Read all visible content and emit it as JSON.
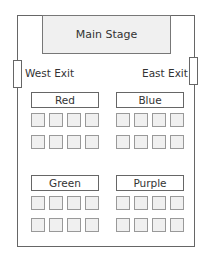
{
  "stage": {
    "label": "Main Stage"
  },
  "exits": {
    "west": {
      "label": "West Exit"
    },
    "east": {
      "label": "East Exit"
    }
  },
  "sections": [
    {
      "name": "Red",
      "rows": 2,
      "seats_per_row": 4
    },
    {
      "name": "Blue",
      "rows": 2,
      "seats_per_row": 4
    },
    {
      "name": "Green",
      "rows": 2,
      "seats_per_row": 4
    },
    {
      "name": "Purple",
      "rows": 2,
      "seats_per_row": 4
    }
  ],
  "colors": {
    "seat_fill": "#f0f0f0",
    "stage_fill": "#f0f0f0",
    "outline": "#666666"
  }
}
